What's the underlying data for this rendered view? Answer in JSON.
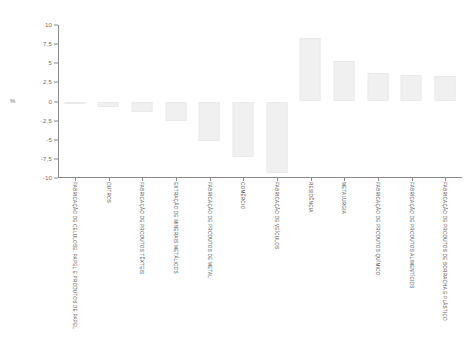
{
  "chart_data": {
    "type": "bar",
    "title": "",
    "xlabel": "",
    "ylabel": "%",
    "ylim": [
      -10,
      10
    ],
    "yticks": [
      "10",
      "7,5",
      "5",
      "2,5",
      "0",
      "-2,5",
      "-5",
      "-7,5",
      "-10"
    ],
    "ytick_values": [
      10,
      7.5,
      5,
      2.5,
      0,
      -2.5,
      -5,
      -7.5,
      -10
    ],
    "grid": false,
    "legend": "none",
    "bar_color": "#f0f0f0",
    "bar_edge_color": "#eaeaea",
    "axis_color": "#8a8a8a",
    "categories": [
      "FABRICAÇÃO DE CELULOSE, PAPEL E PRODUTOS DE PAPEL",
      "OUTROS",
      "FABRICAÇÃO DE PRODUTOS TÊXTEIS",
      "EXTRAÇÃO DE MINERAIS METÁLICOS",
      "FABRICAÇÃO DE PRODUTOS DE METAL",
      "COMÉRCIO",
      "FABRICAÇÃO DE VEÍCULOS",
      "RESIDÊNCIA",
      "METALURGIA",
      "FABRICAÇÃO DE PRODUTOS QUÍMICO",
      "FABRICAÇÃO DE PRODUTOS ALIMENTÍCIOS",
      "FABRICAÇÃO DE PRODUTOS DE BORRACHA E PLÁSTICO"
    ],
    "values": [
      -0.2,
      -0.7,
      -1.4,
      -2.6,
      -5.1,
      -7.3,
      -9.3,
      8.3,
      5.3,
      3.7,
      3.4,
      3.3
    ]
  }
}
